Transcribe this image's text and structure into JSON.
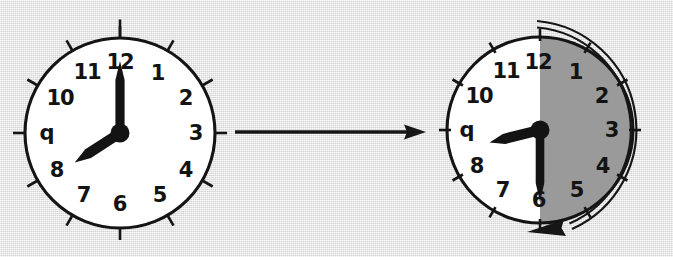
{
  "scene": {
    "title": "Clock time transformation: elapsed half hour",
    "background_color": "#e9e9e9",
    "ink_color": "#141414",
    "shade_color": "#9a9a9a",
    "face_color": "#ffffff",
    "width": 673,
    "height": 257
  },
  "clock_left": {
    "label": "before-clock",
    "time": "8:00",
    "hour_value": 8,
    "minute_value": 0,
    "hour_hand_angle_deg": 237,
    "minute_hand_angle_deg": 0,
    "center_x": 120,
    "center_y": 133,
    "radius": 95,
    "shaded": false,
    "numerals": [
      "12",
      "1",
      "2",
      "3",
      "4",
      "5",
      "6",
      "7",
      "8",
      "q",
      "10",
      "11"
    ]
  },
  "clock_right": {
    "label": "after-clock",
    "time": "8:30",
    "hour_value": 8,
    "minute_value": 30,
    "hour_hand_angle_deg": 256,
    "minute_hand_angle_deg": 180,
    "center_x": 540,
    "center_y": 130,
    "radius": 93,
    "shaded": true,
    "shaded_from_deg": 0,
    "shaded_to_deg": 180,
    "numerals": [
      "12",
      "1",
      "2",
      "3",
      "4",
      "5",
      "6",
      "7",
      "8",
      "q",
      "10",
      "11"
    ]
  },
  "transition_arrow": {
    "label": "transition-arrow",
    "direction": "right",
    "x_start": 235,
    "x_end": 426,
    "y": 132
  },
  "sweep_arrow": {
    "label": "elapsed-sweep-arrow",
    "direction": "clockwise",
    "start_clock_position": "12",
    "end_clock_position": "6",
    "sweep_deg": 180,
    "style": "double-line-outline-with-solid-arrowhead"
  }
}
